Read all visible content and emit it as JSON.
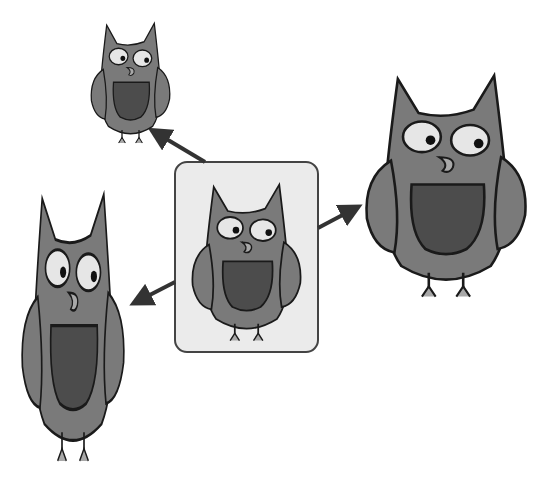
{
  "diagram": {
    "colors": {
      "background": "#ffffff",
      "box_fill": "#ebebeb",
      "box_stroke": "#444444",
      "body": "#7a7a7a",
      "belly": "#4c4c4c",
      "eye": "#e6e6e6",
      "pupil": "#111111",
      "beak": "#a8a8a8",
      "outline": "#1a1a1a",
      "arrow": "#333333"
    },
    "nodes": [
      {
        "id": "original",
        "label": "original-owl",
        "x": 175,
        "y": 162,
        "w": 143,
        "h": 190
      },
      {
        "id": "small",
        "label": "scaled-down-owl",
        "x": 90,
        "y": 20,
        "w": 80,
        "h": 120
      },
      {
        "id": "wide",
        "label": "scaled-up-owl",
        "x": 360,
        "y": 60,
        "w": 170,
        "h": 240
      },
      {
        "id": "tall",
        "label": "stretched-vertical-owl",
        "x": 20,
        "y": 175,
        "w": 110,
        "h": 290
      }
    ],
    "arrows": [
      {
        "from": "original",
        "to": "small"
      },
      {
        "from": "original",
        "to": "wide"
      },
      {
        "from": "original",
        "to": "tall"
      }
    ]
  }
}
